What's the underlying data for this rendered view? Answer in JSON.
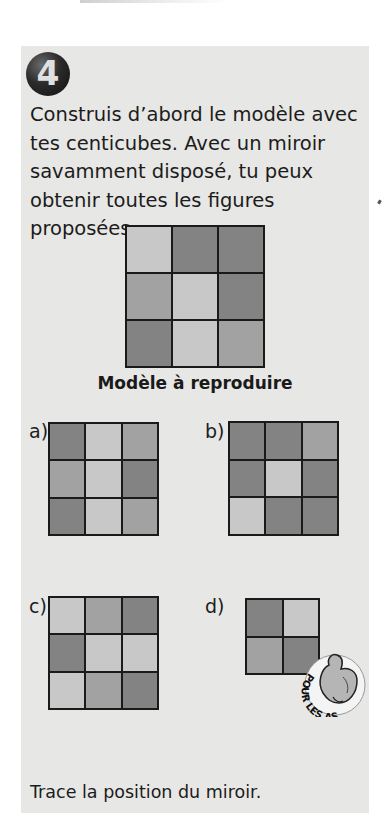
{
  "exercise": {
    "number": "4",
    "instructions": [
      "Construis d’abord le modèle avec",
      "tes centicubes. Avec un miroir",
      "savamment disposé, tu peux",
      "obtenir toutes les figures proposées."
    ],
    "model": {
      "caption": "Modèle à reproduire",
      "cells": [
        [
          "light",
          "dark",
          "dark"
        ],
        [
          "medium",
          "light",
          "dark"
        ],
        [
          "dark",
          "light",
          "medium"
        ]
      ]
    },
    "figures": [
      {
        "label": "a)",
        "cells": [
          [
            "dark",
            "light",
            "medium"
          ],
          [
            "medium",
            "light",
            "dark"
          ],
          [
            "dark",
            "light",
            "medium"
          ]
        ]
      },
      {
        "label": "b)",
        "cells": [
          [
            "dark",
            "dark",
            "medium"
          ],
          [
            "dark",
            "light",
            "dark"
          ],
          [
            "light",
            "dark",
            "dark"
          ]
        ]
      },
      {
        "label": "c)",
        "cells": [
          [
            "light",
            "medium",
            "dark"
          ],
          [
            "dark",
            "light",
            "light"
          ],
          [
            "light",
            "medium",
            "dark"
          ]
        ]
      },
      {
        "label": "d)",
        "cells": [
          [
            "dark",
            "light"
          ],
          [
            "medium",
            "dark"
          ]
        ]
      }
    ],
    "aces_badge": "POUR LES AS",
    "footer": "Trace la position du miroir."
  },
  "colors": {
    "panel_bg": "#e7e7e5",
    "light": "#c8c8c8",
    "medium": "#a2a2a2",
    "dark": "#838383",
    "grid_line": "#1a1a1a"
  }
}
